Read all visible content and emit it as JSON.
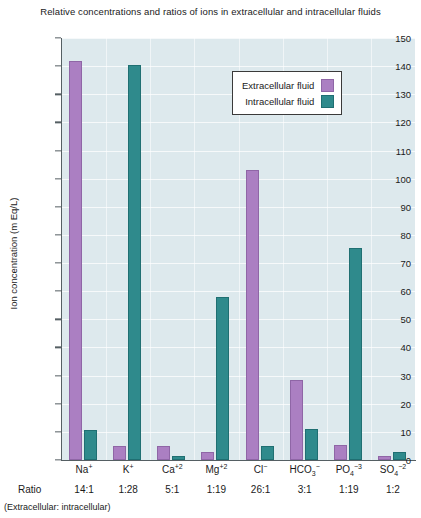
{
  "chart_data": {
    "type": "bar",
    "title": "Relative concentrations and ratios of ions in extracellular and intracellular fluids",
    "xlabel": "",
    "ylabel": "Ion concentration (m Eq/L)",
    "ylim": [
      0,
      150
    ],
    "ytick_step": 10,
    "grid": true,
    "legend_position": "top-right",
    "categories": [
      "Na⁺",
      "K⁺",
      "Ca⁺²",
      "Mg⁺²",
      "Cl⁻",
      "HCO₃⁻",
      "PO₄⁻³",
      "SO₄⁻²"
    ],
    "category_parts": [
      {
        "base": "Na",
        "sup": "+"
      },
      {
        "base": "K",
        "sup": "+"
      },
      {
        "base": "Ca",
        "sup": "+2"
      },
      {
        "base": "Mg",
        "sup": "+2"
      },
      {
        "base": "Cl",
        "sup": "−"
      },
      {
        "base": "HCO",
        "sub": "3",
        "sup": "−"
      },
      {
        "base": "PO",
        "sub": "4",
        "sup": "−3"
      },
      {
        "base": "SO",
        "sub": "4",
        "sup": "−2"
      }
    ],
    "series": [
      {
        "name": "Extracellular fluid",
        "color": "#ab7fc2",
        "values": [
          142,
          5,
          5,
          3,
          103,
          28.5,
          5.5,
          1.5
        ]
      },
      {
        "name": "Intracellular fluid",
        "color": "#2f8a8c",
        "values": [
          10.5,
          140.5,
          1.5,
          58,
          5,
          11,
          75.5,
          3
        ]
      }
    ],
    "ytick_labels": [
      "150",
      "140",
      "130",
      "120",
      "110",
      "100",
      "90",
      "80",
      "70",
      "60",
      "50",
      "40",
      "30",
      "20",
      "10",
      "0"
    ],
    "ytick_values": [
      150,
      140,
      130,
      120,
      110,
      100,
      90,
      80,
      70,
      60,
      50,
      40,
      30,
      20,
      10,
      0
    ],
    "ratio_label": "Ratio",
    "ratio_note": "(Extracellular: intracellular)",
    "ratios": [
      "14:1",
      "1:28",
      "5:1",
      "1:19",
      "26:1",
      "3:1",
      "1:19",
      "1:2"
    ],
    "colors": {
      "extracellular": "#ab7fc2",
      "intracellular": "#2f8a8c",
      "plot_background": "#dde9ed",
      "axis": "#555f63",
      "page_background": "#ffffff"
    }
  }
}
